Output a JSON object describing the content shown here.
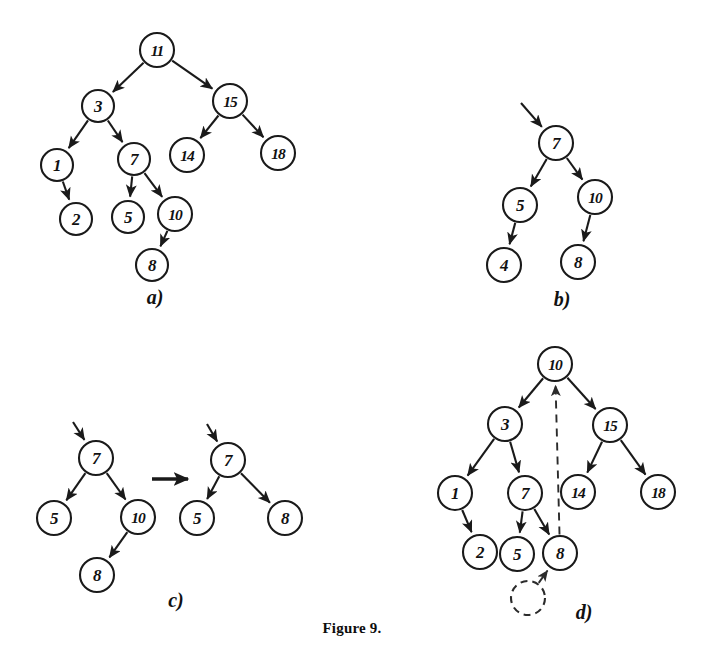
{
  "figure": {
    "caption": "Figure 9.",
    "caption_y": 628,
    "background": "#ffffff",
    "ink": "#1a1a1a",
    "width": 704,
    "height": 656
  },
  "panels": [
    {
      "id": "a",
      "label": "a)",
      "label_x": 155,
      "label_y": 297,
      "description": "binary search tree before deletion",
      "nodes": [
        {
          "id": "a11",
          "value": "11",
          "x": 157,
          "y": 50,
          "r": 17,
          "style": "solid"
        },
        {
          "id": "a3",
          "value": "3",
          "x": 98,
          "y": 106,
          "r": 16,
          "style": "solid"
        },
        {
          "id": "a15",
          "value": "15",
          "x": 230,
          "y": 101,
          "r": 17,
          "style": "solid"
        },
        {
          "id": "a1",
          "value": "1",
          "x": 57,
          "y": 165,
          "r": 16,
          "style": "solid"
        },
        {
          "id": "a7",
          "value": "7",
          "x": 134,
          "y": 159,
          "r": 16,
          "style": "solid"
        },
        {
          "id": "a14",
          "value": "14",
          "x": 187,
          "y": 155,
          "r": 17,
          "style": "solid"
        },
        {
          "id": "a18",
          "value": "18",
          "x": 278,
          "y": 153,
          "r": 17,
          "style": "solid"
        },
        {
          "id": "a2",
          "value": "2",
          "x": 76,
          "y": 219,
          "r": 16,
          "style": "solid"
        },
        {
          "id": "a5",
          "value": "5",
          "x": 128,
          "y": 217,
          "r": 16,
          "style": "solid"
        },
        {
          "id": "a10",
          "value": "10",
          "x": 175,
          "y": 214,
          "r": 17,
          "style": "solid"
        },
        {
          "id": "a8",
          "value": "8",
          "x": 152,
          "y": 265,
          "r": 16,
          "style": "solid"
        }
      ],
      "edges": [
        {
          "from": "a11",
          "to": "a3",
          "style": "solid"
        },
        {
          "from": "a11",
          "to": "a15",
          "style": "solid"
        },
        {
          "from": "a3",
          "to": "a1",
          "style": "solid"
        },
        {
          "from": "a3",
          "to": "a7",
          "style": "solid"
        },
        {
          "from": "a15",
          "to": "a14",
          "style": "solid"
        },
        {
          "from": "a15",
          "to": "a18",
          "style": "solid"
        },
        {
          "from": "a1",
          "to": "a2",
          "style": "solid"
        },
        {
          "from": "a7",
          "to": "a5",
          "style": "solid"
        },
        {
          "from": "a7",
          "to": "a10",
          "style": "solid"
        },
        {
          "from": "a10",
          "to": "a8",
          "style": "solid"
        }
      ],
      "stub_arrows": []
    },
    {
      "id": "b",
      "label": "b)",
      "label_x": 562,
      "label_y": 299,
      "description": "subtree rooted at 7 with successor 4",
      "nodes": [
        {
          "id": "b7",
          "value": "7",
          "x": 556,
          "y": 143,
          "r": 17,
          "style": "solid"
        },
        {
          "id": "b5",
          "value": "5",
          "x": 520,
          "y": 205,
          "r": 17,
          "style": "solid"
        },
        {
          "id": "b10",
          "value": "10",
          "x": 595,
          "y": 197,
          "r": 17,
          "style": "solid"
        },
        {
          "id": "b4",
          "value": "4",
          "x": 504,
          "y": 265,
          "r": 17,
          "style": "solid"
        },
        {
          "id": "b8",
          "value": "8",
          "x": 578,
          "y": 262,
          "r": 17,
          "style": "solid"
        }
      ],
      "edges": [
        {
          "from": "b7",
          "to": "b5",
          "style": "solid"
        },
        {
          "from": "b7",
          "to": "b10",
          "style": "solid"
        },
        {
          "from": "b5",
          "to": "b4",
          "style": "solid"
        },
        {
          "from": "b10",
          "to": "b8",
          "style": "solid"
        }
      ],
      "stub_arrows": [
        {
          "x1": 521,
          "y1": 103,
          "to": "b7"
        }
      ]
    },
    {
      "id": "c",
      "label": "c)",
      "label_x": 176,
      "label_y": 600,
      "description": "subtree before and after removing node 10",
      "nodes": [
        {
          "id": "c7",
          "value": "7",
          "x": 96,
          "y": 458,
          "r": 17,
          "style": "solid"
        },
        {
          "id": "c5",
          "value": "5",
          "x": 54,
          "y": 518,
          "r": 17,
          "style": "solid"
        },
        {
          "id": "c10",
          "value": "10",
          "x": 138,
          "y": 517,
          "r": 17,
          "style": "solid"
        },
        {
          "id": "c8",
          "value": "8",
          "x": 97,
          "y": 575,
          "r": 17,
          "style": "solid"
        },
        {
          "id": "c7b",
          "value": "7",
          "x": 228,
          "y": 460,
          "r": 17,
          "style": "solid"
        },
        {
          "id": "c5b",
          "value": "5",
          "x": 197,
          "y": 518,
          "r": 17,
          "style": "solid"
        },
        {
          "id": "c8b",
          "value": "8",
          "x": 285,
          "y": 518,
          "r": 17,
          "style": "solid"
        }
      ],
      "edges": [
        {
          "from": "c7",
          "to": "c5",
          "style": "solid"
        },
        {
          "from": "c7",
          "to": "c10",
          "style": "solid"
        },
        {
          "from": "c10",
          "to": "c8",
          "style": "solid"
        },
        {
          "from": "c7b",
          "to": "c5b",
          "style": "solid"
        },
        {
          "from": "c7b",
          "to": "c8b",
          "style": "solid"
        }
      ],
      "stub_arrows": [
        {
          "x1": 73,
          "y1": 422,
          "to": "c7"
        },
        {
          "x1": 207,
          "y1": 424,
          "to": "c7b"
        }
      ],
      "transform_arrow": {
        "x1": 152,
        "y1": 479,
        "x2": 188,
        "y2": 479
      }
    },
    {
      "id": "d",
      "label": "d)",
      "label_x": 584,
      "label_y": 612,
      "description": "tree after deletion with node 10 promoted to root",
      "nodes": [
        {
          "id": "d10",
          "value": "10",
          "x": 555,
          "y": 364,
          "r": 17,
          "style": "solid"
        },
        {
          "id": "d3",
          "value": "3",
          "x": 505,
          "y": 424,
          "r": 17,
          "style": "solid"
        },
        {
          "id": "d15",
          "value": "15",
          "x": 610,
          "y": 425,
          "r": 17,
          "style": "solid"
        },
        {
          "id": "d1",
          "value": "1",
          "x": 455,
          "y": 493,
          "r": 17,
          "style": "solid"
        },
        {
          "id": "d7",
          "value": "7",
          "x": 525,
          "y": 493,
          "r": 17,
          "style": "solid"
        },
        {
          "id": "d14",
          "value": "14",
          "x": 578,
          "y": 492,
          "r": 17,
          "style": "solid"
        },
        {
          "id": "d18",
          "value": "18",
          "x": 658,
          "y": 492,
          "r": 17,
          "style": "solid"
        },
        {
          "id": "d2",
          "value": "2",
          "x": 480,
          "y": 552,
          "r": 17,
          "style": "solid"
        },
        {
          "id": "d5",
          "value": "5",
          "x": 517,
          "y": 554,
          "r": 17,
          "style": "solid"
        },
        {
          "id": "d8",
          "value": "8",
          "x": 560,
          "y": 553,
          "r": 17,
          "style": "solid"
        },
        {
          "id": "dghost",
          "value": "",
          "x": 528,
          "y": 598,
          "r": 17,
          "style": "dashed"
        }
      ],
      "edges": [
        {
          "from": "d10",
          "to": "d3",
          "style": "solid"
        },
        {
          "from": "d10",
          "to": "d15",
          "style": "solid"
        },
        {
          "from": "d3",
          "to": "d1",
          "style": "solid"
        },
        {
          "from": "d3",
          "to": "d7",
          "style": "solid"
        },
        {
          "from": "d15",
          "to": "d14",
          "style": "solid"
        },
        {
          "from": "d15",
          "to": "d18",
          "style": "solid"
        },
        {
          "from": "d1",
          "to": "d2",
          "style": "solid"
        },
        {
          "from": "d7",
          "to": "d5",
          "style": "solid"
        },
        {
          "from": "d7",
          "to": "d8",
          "style": "solid"
        },
        {
          "from": "d8",
          "to": "d10",
          "style": "dashed"
        },
        {
          "from": "dghost",
          "to": "d8",
          "style": "dashed"
        }
      ],
      "stub_arrows": []
    }
  ]
}
